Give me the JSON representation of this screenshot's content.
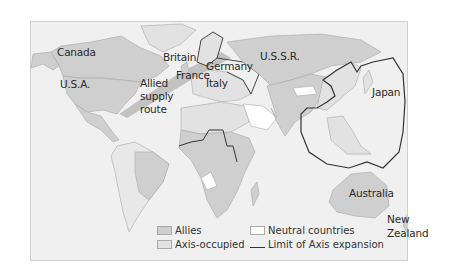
{
  "map": {
    "labels": {
      "canada": "Canada",
      "usa": "U.S.A.",
      "britain": "Britain",
      "germany": "Germany",
      "france": "France",
      "italy": "Italy",
      "ussr": "U.S.S.R.",
      "allied_route_line1": "Allied",
      "allied_route_line2": "supply",
      "allied_route_line3": "route",
      "japan": "Japan",
      "australia": "Australia",
      "new_zealand_line1": "New",
      "new_zealand_line2": "Zealand"
    },
    "legend": {
      "allies": "Allies",
      "axis_occupied": "Axis-occupied",
      "neutral": "Neutral countries",
      "limit": "Limit of Axis expansion"
    },
    "colors": {
      "ocean": "#f0f0f0",
      "allies": "#cfcfcf",
      "axis_occupied": "#e2e2e2",
      "neutral": "#ffffff",
      "supply_route": "#bdbdbd",
      "axis_limit_line": "#333333",
      "border": "#a8a8a8"
    }
  }
}
